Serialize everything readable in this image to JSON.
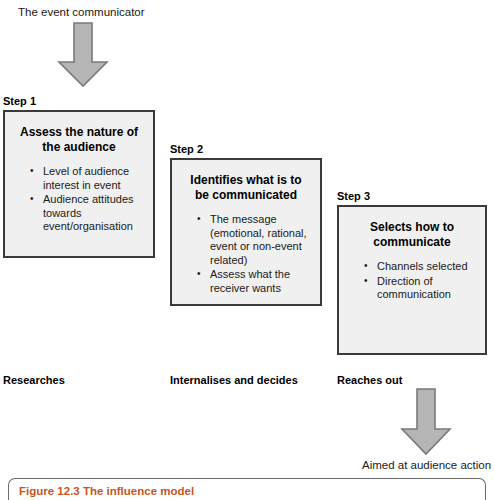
{
  "figure": {
    "top_label": "The event communicator",
    "outcome_label": "Aimed at audience action",
    "caption": "Figure 12.3 The influence model",
    "caption_color": "#c8561e",
    "arrow_fill": "#b5b5b5",
    "arrow_stroke": "#7a7a7a",
    "box_fill": "#f0f0f0",
    "box_border": "#3a3a3a"
  },
  "steps": [
    {
      "label": "Step 1",
      "title": "Assess the nature of the audience",
      "bullets": [
        "Level of audience interest in event",
        "Audience attitudes towards event/organisation"
      ],
      "phase": "Researches"
    },
    {
      "label": "Step 2",
      "title": "Identifies what is to be communicated",
      "bullets": [
        "The message (emotional, rational, event or non-event related)",
        "Assess what the receiver wants"
      ],
      "phase": "Internalises and decides"
    },
    {
      "label": "Step 3",
      "title": "Selects how to communicate",
      "bullets": [
        "Channels selected",
        "Direction of communication"
      ],
      "phase": "Reaches out"
    }
  ],
  "arrows": [
    {
      "name": "top-down-arrow"
    },
    {
      "name": "bottom-down-arrow"
    }
  ]
}
